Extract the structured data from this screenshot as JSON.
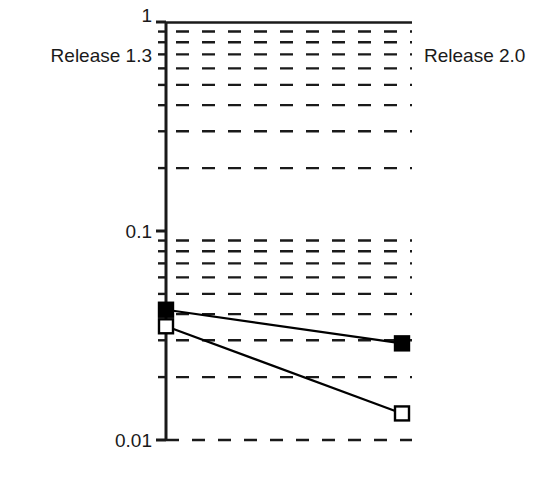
{
  "chart_data": {
    "type": "line",
    "title": "",
    "xlabel": "",
    "ylabel": "",
    "yscale": "log",
    "ylim": [
      0.01,
      1
    ],
    "grid": true,
    "grid_style": "dashed-horizontal",
    "legend_position": "inline-endpoints",
    "categories": [
      "Release 1.3",
      "Release 2.0"
    ],
    "y_tick_labels": [
      "1",
      "0.1",
      "0.01"
    ],
    "y_tick_values": [
      1,
      0.1,
      0.01
    ],
    "y_minor_ticks": [
      0.9,
      0.8,
      0.7,
      0.6,
      0.5,
      0.4,
      0.3,
      0.2,
      0.09,
      0.08,
      0.07,
      0.06,
      0.05,
      0.04,
      0.03,
      0.02
    ],
    "series": [
      {
        "name": "Release 1.3",
        "marker": "filled-square",
        "values": [
          0.042,
          0.029
        ]
      },
      {
        "name": "Release 2.0",
        "marker": "open-square",
        "values": [
          0.035,
          0.0134
        ]
      }
    ],
    "annotations": [
      {
        "name": "left-label",
        "text": "Release 1.3"
      },
      {
        "name": "right-label",
        "text": "Release 2.0"
      }
    ],
    "colors": {
      "line": "#000000",
      "marker_fill": "#000000",
      "marker_open_fill": "#ffffff",
      "grid": "#1a1a1a",
      "axis": "#1a1a1a",
      "background": "#ffffff"
    }
  },
  "axis": {
    "tick_top": "1",
    "tick_mid": "0.1",
    "tick_bottom": "0.01"
  },
  "labels": {
    "left": "Release 1.3",
    "right": "Release 2.0"
  }
}
